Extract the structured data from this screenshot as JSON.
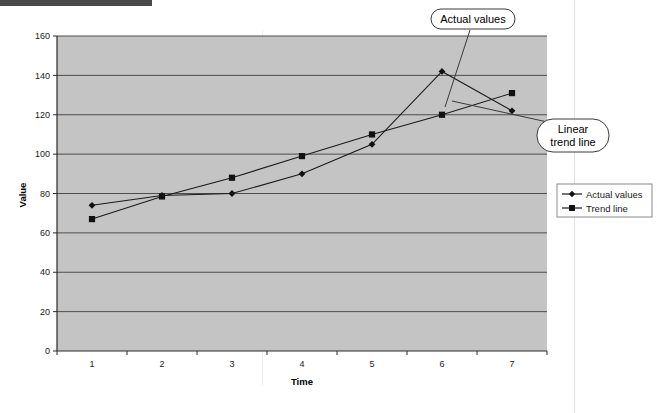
{
  "chart_data": {
    "type": "line",
    "title": "",
    "xlabel": "Time",
    "ylabel": "Value",
    "categories": [
      "1",
      "2",
      "3",
      "4",
      "5",
      "6",
      "7"
    ],
    "x": [
      1,
      2,
      3,
      4,
      5,
      6,
      7
    ],
    "series": [
      {
        "name": "Actual values",
        "marker": "diamond",
        "values": [
          74,
          79,
          80,
          90,
          105,
          142,
          122
        ]
      },
      {
        "name": "Trend line",
        "marker": "square",
        "values": [
          67,
          78.5,
          88,
          99,
          110,
          120,
          131
        ]
      }
    ],
    "ylim": [
      0,
      160
    ],
    "yticks": [
      0,
      20,
      40,
      60,
      80,
      100,
      120,
      140,
      160
    ],
    "ytick_labels": [
      "0",
      "20",
      "40",
      "60",
      "80",
      "100",
      "120",
      "140",
      "160"
    ],
    "grid": "horizontal",
    "legend_position": "right",
    "plot_background": "#c4c4c4",
    "line_color": "#1a1a1a",
    "grid_color": "#4d4d4d"
  },
  "annotations": [
    {
      "id": "actual-values-callout",
      "label": "Actual values",
      "points_to": "Actual values series"
    },
    {
      "id": "linear-trend-line-callout",
      "label_line1": "Linear",
      "label_line2": "trend line",
      "label": "Linear trend line",
      "points_to": "Trend line series"
    }
  ],
  "legend": {
    "items": [
      {
        "label": "Actual values",
        "marker": "diamond"
      },
      {
        "label": "Trend line",
        "marker": "square"
      }
    ]
  },
  "axes": {
    "y_title": "Value",
    "x_title": "Time"
  }
}
